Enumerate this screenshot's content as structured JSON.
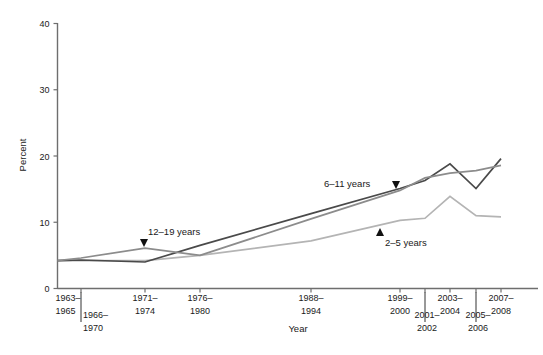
{
  "chart_data": {
    "type": "line",
    "title": "",
    "xlabel": "Year",
    "ylabel": "Percent",
    "ylim": [
      0,
      40
    ],
    "yticks": [
      0,
      10,
      20,
      30,
      40
    ],
    "ytick_labels": [
      "0",
      "10",
      "20",
      "30",
      "40"
    ],
    "grid": false,
    "legend": "inline-annotations",
    "categories": [
      "1963–1965",
      "1966–1970",
      "1971–1974",
      "1976–1980",
      "1988–1994",
      "1999–2000",
      "2001–2002",
      "2003–2004",
      "2005–2006",
      "2007–2008"
    ],
    "category_rows": [
      {
        "label": "1963–1965",
        "row": 0
      },
      {
        "label": "1966–1970",
        "row": 1
      },
      {
        "label": "1971–1974",
        "row": 0
      },
      {
        "label": "1976–1980",
        "row": 0
      },
      {
        "label": "1988–1994",
        "row": 0
      },
      {
        "label": "1999–2000",
        "row": 0
      },
      {
        "label": "2001–2002",
        "row": 1
      },
      {
        "label": "2003–2004",
        "row": 0
      },
      {
        "label": "2005–2006",
        "row": 1
      },
      {
        "label": "2007–2008",
        "row": 0
      }
    ],
    "series": [
      {
        "name": "2–5 years",
        "color": "#b4b4b4",
        "values": [
          4.2,
          4.2,
          4.2,
          5.0,
          7.2,
          10.3,
          10.6,
          13.9,
          11.0,
          10.8
        ]
      },
      {
        "name": "6–11 years",
        "color": "#4a4a4a",
        "values": [
          4.2,
          4.3,
          4.0,
          6.5,
          11.3,
          15.1,
          16.3,
          18.8,
          15.1,
          19.6
        ]
      },
      {
        "name": "12–19 years",
        "color": "#8c8c8c",
        "values": [
          4.2,
          4.6,
          6.1,
          5.0,
          10.5,
          14.8,
          16.7,
          17.4,
          17.8,
          18.6
        ]
      }
    ],
    "annotations": [
      {
        "text": "12–19 years",
        "series": "12–19 years",
        "marker": "down-triangle"
      },
      {
        "text": "6–11 years",
        "series": "6–11 years",
        "marker": "down-triangle"
      },
      {
        "text": "2–5 years",
        "series": "2–5 years",
        "marker": "up-triangle"
      }
    ]
  },
  "axes": {
    "y_title": "Percent",
    "x_title": "Year"
  }
}
